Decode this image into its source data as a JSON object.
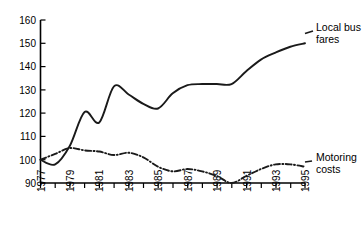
{
  "chart_data": {
    "type": "line",
    "title": "",
    "xlabel": "",
    "ylabel": "",
    "xlim": [
      1977,
      1995
    ],
    "ylim": [
      90,
      160
    ],
    "grid": false,
    "legend_position": "inline-right",
    "y_ticks": [
      90,
      100,
      110,
      120,
      130,
      140,
      150,
      160
    ],
    "x_ticks": [
      1977,
      1978,
      1979,
      1980,
      1981,
      1982,
      1983,
      1984,
      1985,
      1986,
      1987,
      1988,
      1989,
      1990,
      1991,
      1992,
      1993,
      1994,
      1995
    ],
    "x_tick_labels": [
      "1977",
      "",
      "1979",
      "",
      "1981",
      "",
      "1983",
      "",
      "1985",
      "",
      "1987",
      "",
      "1989",
      "",
      "1991",
      "",
      "1993",
      "",
      "1995"
    ],
    "x": [
      1977,
      1978,
      1979,
      1980,
      1981,
      1982,
      1983,
      1984,
      1985,
      1986,
      1987,
      1988,
      1989,
      1990,
      1991,
      1992,
      1993,
      1994,
      1995
    ],
    "series": [
      {
        "name": "Local bus fares",
        "style": "solid",
        "values": [
          100,
          98,
          106,
          120.5,
          116,
          131.5,
          128,
          124,
          122,
          128.5,
          132,
          132.5,
          132.5,
          132.5,
          138,
          143,
          146,
          148.5,
          150
        ]
      },
      {
        "name": "Motoring costs",
        "style": "dash-dot",
        "values": [
          100,
          102.5,
          105,
          104,
          103.5,
          102,
          103,
          101,
          97,
          95,
          96,
          95,
          93,
          90,
          93,
          96,
          98,
          98,
          97
        ]
      }
    ],
    "annotations": [
      {
        "text": "Local bus fares",
        "series": "Local bus fares"
      },
      {
        "text": "Motoring costs",
        "series": "Motoring costs"
      }
    ]
  },
  "labels": {
    "y": [
      "160",
      "150",
      "140",
      "130",
      "120",
      "110",
      "100",
      "90"
    ],
    "x": [
      "1977",
      "1979",
      "1981",
      "1983",
      "1985",
      "1987",
      "1989",
      "1991",
      "1993",
      "1995"
    ],
    "series_bus_line1": "Local bus",
    "series_bus_line2": "fares",
    "series_motoring_line1": "Motoring",
    "series_motoring_line2": "costs"
  },
  "colors": {
    "ink": "#1a1a1a",
    "axis": "#000000",
    "background": "#ffffff"
  }
}
